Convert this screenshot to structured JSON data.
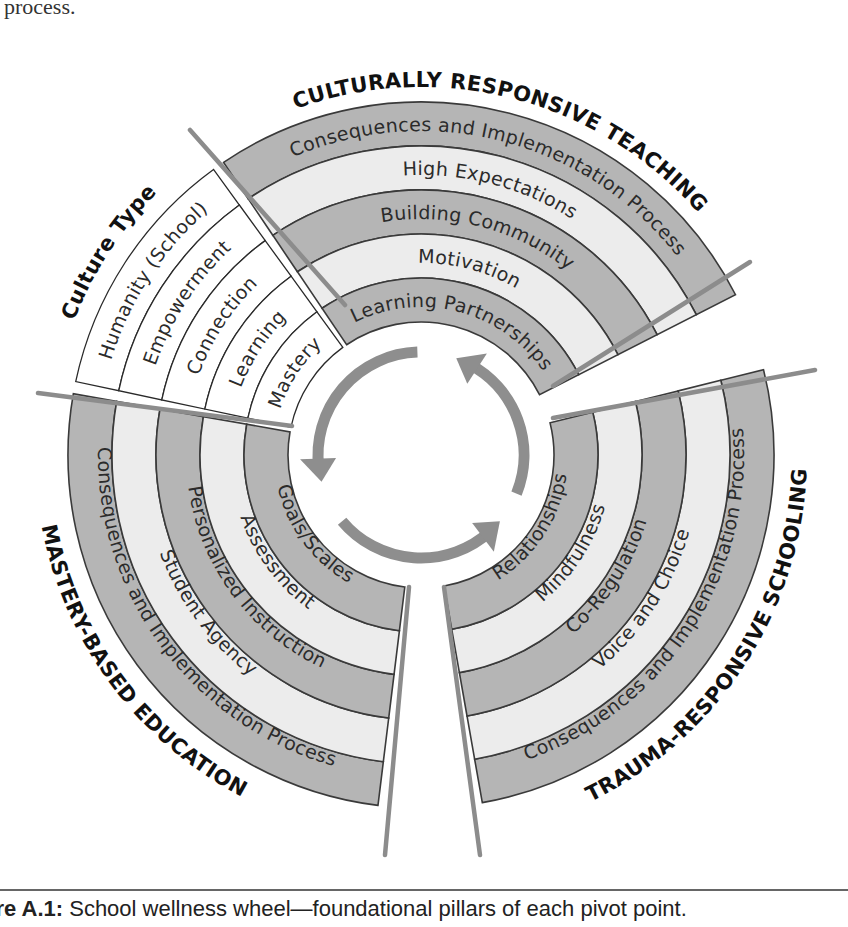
{
  "intro_text": "process.",
  "caption": {
    "label": "ure A.1:",
    "text": " School wellness wheel—foundational pillars of each pivot point."
  },
  "colors": {
    "dark_band": "#b5b5b5",
    "light_band": "#ececec",
    "separator": "#8c8c8c",
    "arrow": "#8e8e8e"
  },
  "wheel": {
    "sections": [
      {
        "title": "CULTURALLY RESPONSIVE TEACHING",
        "rings": [
          "Consequences and Implementation Process",
          "High Expectations",
          "Building Community",
          "Motivation",
          "Learning Partnerships"
        ]
      },
      {
        "title": "TRAUMA-RESPONSIVE SCHOOLING",
        "rings": [
          "Consequences and Implementation Process",
          "Voice and Choice",
          "Co-Regulation",
          "Mindfulness",
          "Relationships"
        ]
      },
      {
        "title": "MASTERY-BASED EDUCATION",
        "rings": [
          "Consequences and Implementation Process",
          "Student Agency",
          "Personalized Instruction",
          "Assessment",
          "Goals/Scales"
        ]
      },
      {
        "title": "Culture Type",
        "rings": [
          "Humanity (School)",
          "Empowerment",
          "Connection",
          "Learning",
          "Mastery"
        ]
      }
    ],
    "center_icon": "cycle-arrows-icon"
  }
}
